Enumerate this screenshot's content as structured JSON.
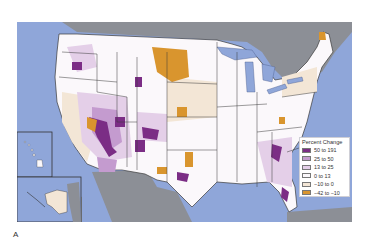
{
  "figure": {
    "panel_label": "A",
    "map_type": "choropleth",
    "region": "United States counties (with Alaska and Hawaii insets)"
  },
  "colors": {
    "ocean": "#8fa6d9",
    "foreign_land": "#8c8f96",
    "state_border": "#3a3a3a"
  },
  "legend": {
    "title": "Percent Change",
    "items": [
      {
        "label": "50 to 191",
        "color": "#7b2d85"
      },
      {
        "label": "25 to 50",
        "color": "#c49bcf"
      },
      {
        "label": "13 to 25",
        "color": "#e4cfe8"
      },
      {
        "label": "0 to 13",
        "color": "#fbf8fb"
      },
      {
        "label": "−10 to 0",
        "color": "#f3e6d6"
      },
      {
        "label": "−42 to −10",
        "color": "#d9952e"
      }
    ]
  }
}
